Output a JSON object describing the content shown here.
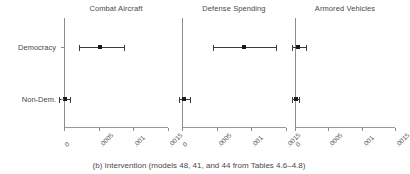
{
  "caption": "(b) Intervention (models 48, 41, and 44 from Tables 4.6–4.8)",
  "y_categories": [
    "Democracy",
    "Non-Dem."
  ],
  "tick_labels": [
    "0",
    ".0005",
    ".001",
    ".0015"
  ],
  "chart_data": {
    "type": "scatter",
    "title": "(b) Intervention (models 48, 41, and 44 from Tables 4.6–4.8)",
    "xlabel": "",
    "ylabel": "",
    "xlim": [
      0,
      0.0015
    ],
    "ticks": [
      0,
      0.0005,
      0.001,
      0.0015
    ],
    "tick_labels": [
      "0",
      ".0005",
      ".001",
      ".0015"
    ],
    "categories": [
      "Democracy",
      "Non-Dem."
    ],
    "grid": false,
    "legend": null,
    "zero_reference_line": 0,
    "panels": [
      {
        "title": "Combat Aircraft",
        "points": [
          {
            "category": "Democracy",
            "estimate": 0.00052,
            "ci_low": 0.00021,
            "ci_high": 0.00086
          },
          {
            "category": "Non-Dem.",
            "estimate": 1e-05,
            "ci_low": -7e-05,
            "ci_high": 9e-05
          }
        ]
      },
      {
        "title": "Defense Spending",
        "points": [
          {
            "category": "Democracy",
            "estimate": 0.0009,
            "ci_low": 0.00044,
            "ci_high": 0.00136
          },
          {
            "category": "Non-Dem.",
            "estimate": 3e-05,
            "ci_low": -4e-05,
            "ci_high": 0.00011
          }
        ]
      },
      {
        "title": "Armored Vehicles",
        "points": [
          {
            "category": "Democracy",
            "estimate": 4e-05,
            "ci_low": -5e-05,
            "ci_high": 0.00016
          },
          {
            "category": "Non-Dem.",
            "estimate": 1e-05,
            "ci_low": -4e-05,
            "ci_high": 6e-05
          }
        ]
      }
    ]
  }
}
